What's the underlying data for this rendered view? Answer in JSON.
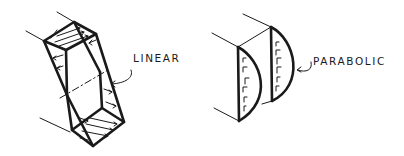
{
  "diagram": {
    "figures": [
      {
        "id": "linear",
        "label": "LINEAR",
        "description": "Beam section with linear (triangular) stress distribution, arrows reversing across the dashed neutral axis"
      },
      {
        "id": "parabolic",
        "label": "PARABOLIC",
        "description": "Beam section with parabolic shear stress distribution on two faces"
      }
    ],
    "colors": {
      "ink": "#1a1a1a",
      "background": "#ffffff"
    }
  }
}
